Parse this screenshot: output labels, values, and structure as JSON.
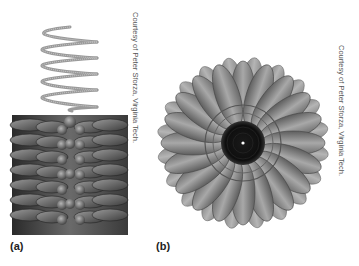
{
  "figure": {
    "panels": [
      {
        "label": "(a)",
        "caption": "Courtesy of Peter Sforza, Virginia Tech.",
        "description": "helical RNA strand above a rod of stacked protein subunits"
      },
      {
        "label": "(b)",
        "caption": "Courtesy of Peter Sforza, Virginia Tech.",
        "description": "end-on view of rod showing ring of protein subunits around central channel"
      }
    ],
    "colors": {
      "background": "#ffffff",
      "subunit": "#8a8a8a",
      "subunit_dark": "#3a3a3a",
      "channel": "#111111",
      "helix": "#9a9a9a"
    }
  }
}
